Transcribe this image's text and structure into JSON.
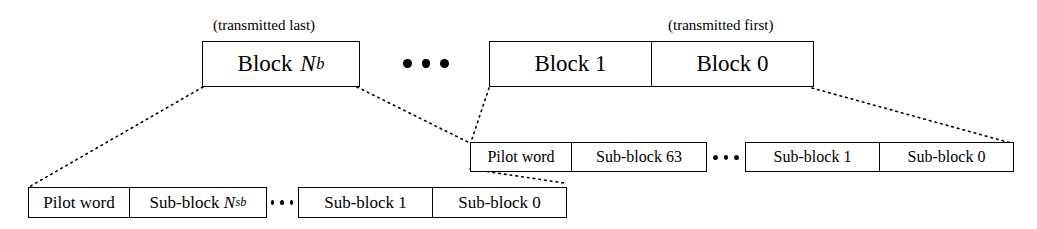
{
  "diagram": {
    "captions": {
      "transmitted_last": "(transmitted last)",
      "transmitted_first": "(transmitted first)"
    },
    "ellipsis": "•••",
    "rows": {
      "blocks": {
        "label": "block-level row",
        "left_group": [
          {
            "text_prefix": "Block ",
            "symbol": "N",
            "subscript": "b",
            "full_text": "Block Nb"
          }
        ],
        "right_group": [
          {
            "full_text": "Block 1"
          },
          {
            "full_text": "Block 0"
          }
        ]
      },
      "block1_expansion": {
        "label": "expansion of Block 1",
        "left_group": [
          {
            "full_text": "Pilot word"
          },
          {
            "full_text": "Sub-block 63"
          }
        ],
        "right_group": [
          {
            "full_text": "Sub-block 1"
          },
          {
            "full_text": "Sub-block 0"
          }
        ]
      },
      "blockNb_expansion": {
        "label": "expansion of Block Nb",
        "left_group": [
          {
            "full_text": "Pilot word"
          },
          {
            "text_prefix": "Sub-block ",
            "symbol": "N",
            "subscript": "sb",
            "full_text": "Sub-block Nsb"
          }
        ],
        "right_group": [
          {
            "full_text": "Sub-block 1"
          },
          {
            "full_text": "Sub-block 0"
          }
        ]
      }
    },
    "colors": {
      "stroke": "#000000",
      "background": "#ffffff"
    }
  }
}
